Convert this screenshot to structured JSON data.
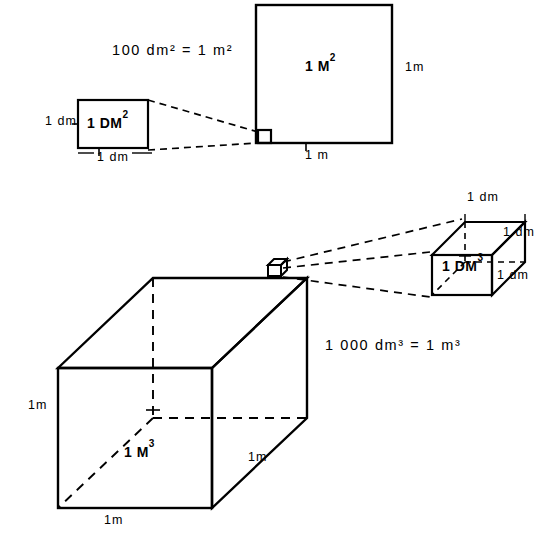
{
  "figure": {
    "title_area_equation": "100 dm² = 1 m²",
    "title_volume_equation": "1 000 dm³ = 1 m³",
    "background_color": "#ffffff",
    "stroke_color": "#000000"
  },
  "area_section": {
    "equation": {
      "number": "100",
      "unit_small": "dm",
      "exp_small": "2",
      "equals": "=",
      "number_big": "1",
      "unit_big": "m",
      "exp_big": "2"
    },
    "small_square": {
      "face_label_text": "1 DM",
      "face_label_exp": "2",
      "label_left": "1  dm",
      "label_bottom": "1   dm"
    },
    "large_square": {
      "face_label_text": "1 M",
      "face_label_exp": "2",
      "label_right": "1m",
      "label_bottom": "1  m"
    }
  },
  "volume_section": {
    "equation": {
      "number": "1 000",
      "unit_small": "dm",
      "exp_small": "3",
      "equals": "=",
      "number_big": "1",
      "unit_big": "m",
      "exp_big": "3"
    },
    "large_cube": {
      "face_label_text": "1 M",
      "face_label_exp": "3",
      "label_left": "1m",
      "label_bottom": "1m",
      "label_right": "1m"
    },
    "small_cube": {
      "face_label_text": "1 DM",
      "face_label_exp": "3",
      "label_top": "1 dm",
      "label_right": "1 dm",
      "label_bottom_right": "1 dm"
    }
  }
}
